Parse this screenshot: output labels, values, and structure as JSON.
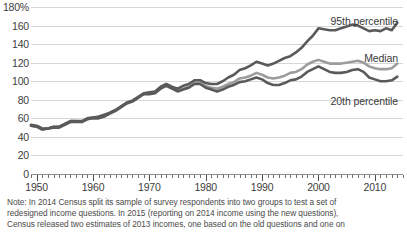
{
  "chart_data": {
    "type": "line",
    "title": "",
    "xlabel": "",
    "ylabel": "",
    "ylim": [
      0,
      180
    ],
    "xlim": [
      1949,
      2015
    ],
    "grid": true,
    "legend_position": "inline-right",
    "y_ticks": [
      "180%",
      "160",
      "140",
      "120",
      "100",
      "80",
      "60",
      "40",
      "20",
      "0"
    ],
    "y_tick_values": [
      180,
      160,
      140,
      120,
      100,
      80,
      60,
      40,
      20,
      0
    ],
    "x_ticks": [
      "1950",
      "1960",
      "1970",
      "1980",
      "1990",
      "2000",
      "2010"
    ],
    "x_tick_values": [
      1950,
      1960,
      1970,
      1980,
      1990,
      2000,
      2010
    ],
    "x_minor_tick_step": 1,
    "series": [
      {
        "name": "95th percentile",
        "color": "#5a5a5a",
        "label_anchor": {
          "x": 2014,
          "y": 176
        },
        "x": [
          1949,
          1950,
          1951,
          1952,
          1953,
          1954,
          1955,
          1956,
          1957,
          1958,
          1959,
          1960,
          1961,
          1962,
          1963,
          1964,
          1965,
          1966,
          1967,
          1968,
          1969,
          1970,
          1971,
          1972,
          1973,
          1974,
          1975,
          1976,
          1977,
          1978,
          1979,
          1980,
          1981,
          1982,
          1983,
          1984,
          1985,
          1986,
          1987,
          1988,
          1989,
          1990,
          1991,
          1992,
          1993,
          1994,
          1995,
          1996,
          1997,
          1998,
          1999,
          2000,
          2001,
          2002,
          2003,
          2004,
          2005,
          2006,
          2007,
          2008,
          2009,
          2010,
          2011,
          2012,
          2013,
          2014
        ],
        "values": [
          53,
          52,
          49,
          49,
          51,
          51,
          54,
          57,
          57,
          57,
          60,
          61,
          62,
          64,
          66,
          69,
          73,
          77,
          79,
          83,
          87,
          88,
          89,
          94,
          97,
          94,
          92,
          95,
          97,
          101,
          101,
          98,
          97,
          97,
          100,
          104,
          107,
          112,
          114,
          117,
          121,
          119,
          117,
          119,
          122,
          125,
          127,
          131,
          136,
          143,
          149,
          157,
          156,
          155,
          155,
          157,
          159,
          161,
          160,
          157,
          154,
          155,
          154,
          157,
          155,
          163
        ]
      },
      {
        "name": "Median",
        "color": "#9c9c9c",
        "label_anchor": {
          "x": 2014,
          "y": 118
        },
        "x": [
          1949,
          1950,
          1951,
          1952,
          1953,
          1954,
          1955,
          1956,
          1957,
          1958,
          1959,
          1960,
          1961,
          1962,
          1963,
          1964,
          1965,
          1966,
          1967,
          1968,
          1969,
          1970,
          1971,
          1972,
          1973,
          1974,
          1975,
          1976,
          1977,
          1978,
          1979,
          1980,
          1981,
          1982,
          1983,
          1984,
          1985,
          1986,
          1987,
          1988,
          1989,
          1990,
          1991,
          1992,
          1993,
          1994,
          1995,
          1996,
          1997,
          1998,
          1999,
          2000,
          2001,
          2002,
          2003,
          2004,
          2005,
          2006,
          2007,
          2008,
          2009,
          2010,
          2011,
          2012,
          2013,
          2014
        ],
        "values": [
          52,
          51,
          48,
          49,
          51,
          51,
          54,
          57,
          57,
          56,
          60,
          61,
          61,
          63,
          66,
          69,
          73,
          77,
          79,
          83,
          87,
          87,
          88,
          93,
          96,
          93,
          90,
          92,
          94,
          98,
          98,
          95,
          93,
          92,
          94,
          97,
          99,
          103,
          104,
          106,
          109,
          107,
          104,
          103,
          104,
          106,
          109,
          110,
          113,
          118,
          121,
          123,
          121,
          119,
          119,
          119,
          120,
          121,
          122,
          120,
          116,
          114,
          113,
          113,
          114,
          119
        ]
      },
      {
        "name": "20th percentile",
        "color": "#5a5a5a",
        "label_anchor": {
          "x": 2014,
          "y": 84
        },
        "x": [
          1949,
          1950,
          1951,
          1952,
          1953,
          1954,
          1955,
          1956,
          1957,
          1958,
          1959,
          1960,
          1961,
          1962,
          1963,
          1964,
          1965,
          1966,
          1967,
          1968,
          1969,
          1970,
          1971,
          1972,
          1973,
          1974,
          1975,
          1976,
          1977,
          1978,
          1979,
          1980,
          1981,
          1982,
          1983,
          1984,
          1985,
          1986,
          1987,
          1988,
          1989,
          1990,
          1991,
          1992,
          1993,
          1994,
          1995,
          1996,
          1997,
          1998,
          1999,
          2000,
          2001,
          2002,
          2003,
          2004,
          2005,
          2006,
          2007,
          2008,
          2009,
          2010,
          2011,
          2012,
          2013,
          2014
        ],
        "values": [
          52,
          51,
          48,
          49,
          50,
          50,
          53,
          56,
          56,
          56,
          59,
          60,
          60,
          62,
          65,
          68,
          72,
          76,
          78,
          82,
          86,
          86,
          87,
          92,
          95,
          92,
          89,
          91,
          93,
          97,
          97,
          93,
          91,
          89,
          91,
          94,
          96,
          99,
          100,
          102,
          104,
          102,
          98,
          96,
          96,
          98,
          101,
          102,
          105,
          110,
          113,
          116,
          113,
          110,
          109,
          109,
          110,
          112,
          113,
          110,
          104,
          102,
          100,
          100,
          101,
          105
        ]
      }
    ]
  },
  "note": {
    "line1": "Note: In 2014 Census split its sample of survey respondents into two groups to test a set of",
    "line2": "redesigned income questions.  In 2015 (reporting on 2014 income using the new questions),",
    "line3": "Census released two estimates of 2013 incomes, one based on the old questions and one on"
  }
}
